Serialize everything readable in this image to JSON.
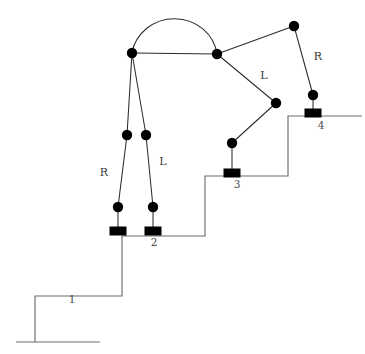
{
  "figure": {
    "background_color": "#ffffff",
    "line_color": "#2b2b2b",
    "stair_color": "#6d6d6d",
    "joint_color": "#000000"
  },
  "labels": {
    "leg_right": "R",
    "leg_left": "L",
    "arm_left": "L",
    "arm_right": "R",
    "step_1": "1",
    "step_2": "2",
    "step_3": "3",
    "step_4": "4"
  },
  "label_positions": {
    "leg_right": {
      "x": 104,
      "y": 173
    },
    "leg_left": {
      "x": 163,
      "y": 162
    },
    "arm_left": {
      "x": 264,
      "y": 76
    },
    "arm_right": {
      "x": 318,
      "y": 57
    },
    "step_1": {
      "x": 72,
      "y": 300
    },
    "step_2": {
      "x": 154,
      "y": 243
    },
    "step_3": {
      "x": 237,
      "y": 185
    },
    "step_4": {
      "x": 321,
      "y": 126
    }
  },
  "joints": [
    {
      "name": "hip-left",
      "x": 132,
      "y": 53,
      "r": 5.2
    },
    {
      "name": "hip-right",
      "x": 217,
      "y": 54,
      "r": 5.2
    },
    {
      "name": "shoulder-right",
      "x": 294,
      "y": 26,
      "r": 5.2
    },
    {
      "name": "elbow-right",
      "x": 313,
      "y": 95,
      "r": 5.2
    },
    {
      "name": "elbow-left",
      "x": 276,
      "y": 103,
      "r": 5.2
    },
    {
      "name": "hand-left",
      "x": 232,
      "y": 143,
      "r": 5.2
    },
    {
      "name": "knee-right",
      "x": 127,
      "y": 135,
      "r": 5.2
    },
    {
      "name": "knee-left",
      "x": 146,
      "y": 135,
      "r": 5.2
    },
    {
      "name": "ankle-right",
      "x": 118,
      "y": 207,
      "r": 5.2
    },
    {
      "name": "ankle-left",
      "x": 153,
      "y": 207,
      "r": 5.2
    }
  ],
  "supports": [
    {
      "name": "support-foot-right",
      "x": 118,
      "y": 231,
      "w": 17,
      "h": 9
    },
    {
      "name": "support-foot-left",
      "x": 153,
      "y": 231,
      "w": 17,
      "h": 9
    },
    {
      "name": "support-hand-left",
      "x": 232,
      "y": 173,
      "w": 17,
      "h": 9
    },
    {
      "name": "support-hand-right",
      "x": 313,
      "y": 113,
      "w": 17,
      "h": 9
    }
  ],
  "segments": [
    {
      "name": "torso-beam",
      "x1": 132,
      "y1": 53,
      "x2": 217,
      "y2": 54
    },
    {
      "name": "thigh-right",
      "x1": 132,
      "y1": 53,
      "x2": 127,
      "y2": 135
    },
    {
      "name": "thigh-left",
      "x1": 132,
      "y1": 53,
      "x2": 146,
      "y2": 135
    },
    {
      "name": "shank-right",
      "x1": 127,
      "y1": 135,
      "x2": 118,
      "y2": 207
    },
    {
      "name": "shank-left",
      "x1": 146,
      "y1": 135,
      "x2": 153,
      "y2": 207
    },
    {
      "name": "foot-stem-right",
      "x1": 118,
      "y1": 207,
      "x2": 118,
      "y2": 228
    },
    {
      "name": "foot-stem-left",
      "x1": 153,
      "y1": 207,
      "x2": 153,
      "y2": 228
    },
    {
      "name": "upperarm-right",
      "x1": 217,
      "y1": 54,
      "x2": 294,
      "y2": 26
    },
    {
      "name": "forearm-right",
      "x1": 294,
      "y1": 26,
      "x2": 313,
      "y2": 95
    },
    {
      "name": "hand-stem-right",
      "x1": 313,
      "y1": 95,
      "x2": 313,
      "y2": 110
    },
    {
      "name": "upperarm-left",
      "x1": 217,
      "y1": 54,
      "x2": 276,
      "y2": 103
    },
    {
      "name": "forearm-left",
      "x1": 276,
      "y1": 103,
      "x2": 232,
      "y2": 143
    },
    {
      "name": "hand-stem-left",
      "x1": 232,
      "y1": 143,
      "x2": 232,
      "y2": 170
    }
  ],
  "arc": {
    "name": "head-arc",
    "start_x": 132,
    "start_y": 53,
    "end_x": 217,
    "end_y": 54,
    "rx": 43,
    "ry": 41,
    "sweep": 1
  },
  "staircase": {
    "name": "stair-profile",
    "points": "35,342 35,296 122,296 122,236 205,236 205,176 288,176 288,116 362,116"
  },
  "ground": {
    "name": "ground-line",
    "x1": 16,
    "y1": 342,
    "x2": 100,
    "y2": 342
  }
}
